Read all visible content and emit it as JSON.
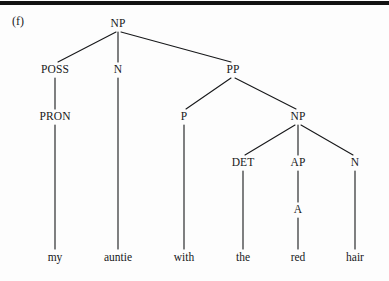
{
  "figure": {
    "label": "(f)",
    "width": 389,
    "height": 281,
    "background_color": "#fdfdfd",
    "ink_color": "#17181a",
    "scan_edge_bar_color": "#121212"
  },
  "tree": {
    "type": "syntax-tree",
    "sentence": "my auntie with the red hair",
    "nodes": [
      {
        "id": "np-root",
        "label": "NP",
        "x": 118,
        "y": 24
      },
      {
        "id": "poss",
        "label": "POSS",
        "x": 55,
        "y": 70
      },
      {
        "id": "n-head",
        "label": "N",
        "x": 118,
        "y": 70
      },
      {
        "id": "pp",
        "label": "PP",
        "x": 233,
        "y": 70
      },
      {
        "id": "pron",
        "label": "PRON",
        "x": 55,
        "y": 117
      },
      {
        "id": "p",
        "label": "P",
        "x": 184,
        "y": 117
      },
      {
        "id": "np-inner",
        "label": "NP",
        "x": 298,
        "y": 117
      },
      {
        "id": "det",
        "label": "DET",
        "x": 243,
        "y": 163
      },
      {
        "id": "ap",
        "label": "AP",
        "x": 298,
        "y": 163
      },
      {
        "id": "n-hair",
        "label": "N",
        "x": 355,
        "y": 163
      },
      {
        "id": "a",
        "label": "A",
        "x": 298,
        "y": 210
      }
    ],
    "leaves": [
      {
        "id": "leaf-my",
        "label": "my",
        "x": 55,
        "y": 258,
        "parent": "pron"
      },
      {
        "id": "leaf-auntie",
        "label": "auntie",
        "x": 118,
        "y": 258,
        "parent": "n-head"
      },
      {
        "id": "leaf-with",
        "label": "with",
        "x": 184,
        "y": 258,
        "parent": "p"
      },
      {
        "id": "leaf-the",
        "label": "the",
        "x": 243,
        "y": 258,
        "parent": "det"
      },
      {
        "id": "leaf-red",
        "label": "red",
        "x": 298,
        "y": 258,
        "parent": "a"
      },
      {
        "id": "leaf-hair",
        "label": "hair",
        "x": 355,
        "y": 258,
        "parent": "n-hair"
      }
    ],
    "edges": [
      {
        "id": "e-np-poss",
        "x1": 116,
        "y1": 32,
        "x2": 58,
        "y2": 62
      },
      {
        "id": "e-np-n",
        "x1": 118,
        "y1": 32,
        "x2": 118,
        "y2": 62
      },
      {
        "id": "e-np-pp",
        "x1": 121,
        "y1": 32,
        "x2": 231,
        "y2": 62
      },
      {
        "id": "e-poss-pron",
        "x1": 55,
        "y1": 78,
        "x2": 55,
        "y2": 109
      },
      {
        "id": "e-pp-p",
        "x1": 231,
        "y1": 78,
        "x2": 186,
        "y2": 109
      },
      {
        "id": "e-pp-np",
        "x1": 235,
        "y1": 78,
        "x2": 296,
        "y2": 109
      },
      {
        "id": "e-npi-det",
        "x1": 295,
        "y1": 125,
        "x2": 245,
        "y2": 155
      },
      {
        "id": "e-npi-ap",
        "x1": 298,
        "y1": 125,
        "x2": 298,
        "y2": 155
      },
      {
        "id": "e-npi-n",
        "x1": 301,
        "y1": 125,
        "x2": 353,
        "y2": 155
      },
      {
        "id": "e-ap-a",
        "x1": 298,
        "y1": 171,
        "x2": 298,
        "y2": 202
      },
      {
        "id": "e-pron-my",
        "x1": 55,
        "y1": 125,
        "x2": 55,
        "y2": 249
      },
      {
        "id": "e-n-auntie",
        "x1": 118,
        "y1": 78,
        "x2": 118,
        "y2": 249
      },
      {
        "id": "e-p-with",
        "x1": 184,
        "y1": 125,
        "x2": 184,
        "y2": 249
      },
      {
        "id": "e-det-the",
        "x1": 243,
        "y1": 171,
        "x2": 243,
        "y2": 249
      },
      {
        "id": "e-a-red",
        "x1": 298,
        "y1": 218,
        "x2": 298,
        "y2": 249
      },
      {
        "id": "e-n-hair",
        "x1": 355,
        "y1": 171,
        "x2": 355,
        "y2": 249
      }
    ]
  }
}
